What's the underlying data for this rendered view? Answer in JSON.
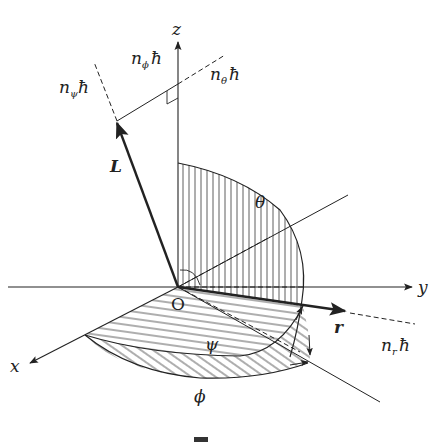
{
  "diagram": {
    "type": "3d-coordinate-geometry",
    "axes": {
      "x": "x",
      "y": "y",
      "z": "z",
      "origin": "O"
    },
    "vectors": {
      "angular_momentum": "L",
      "position": "r"
    },
    "angles": {
      "theta": "θ",
      "phi": "ϕ",
      "psi": "ψ"
    },
    "quantum_labels": {
      "n_phi": {
        "base": "n",
        "sub": "ϕ",
        "suffix": "ħ"
      },
      "n_theta": {
        "base": "n",
        "sub": "θ",
        "suffix": "ħ"
      },
      "n_psi": {
        "base": "n",
        "sub": "ψ",
        "suffix": "ħ"
      },
      "n_r": {
        "base": "n",
        "sub": "r",
        "suffix": "ħ"
      }
    },
    "colors": {
      "stroke": "#222222",
      "background": "#ffffff"
    }
  }
}
